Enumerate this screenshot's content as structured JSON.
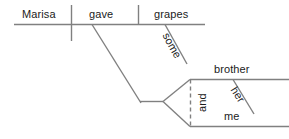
{
  "diagram": {
    "type": "reed-kellogg-sentence-diagram",
    "sentence": "Marisa gave her brother and me some grapes",
    "line_color": "#808080",
    "text_color": "#1b1b1b",
    "words": {
      "subject": "Marisa",
      "verb": "gave",
      "direct_object": "grapes",
      "object_modifier": "some",
      "indirect_object_1": "brother",
      "indirect_object_1_modifier": "her",
      "indirect_object_2": "me",
      "conjunction": "and"
    }
  }
}
